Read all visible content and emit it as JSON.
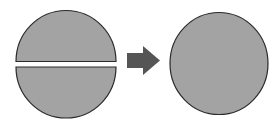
{
  "diagram": {
    "colors": {
      "fill": "#a3a3a3",
      "stroke": "#2a2a2a",
      "arrow": "#555555",
      "background": "#ffffff"
    },
    "left_shape": {
      "label": "split-circle",
      "parts": [
        "top-half",
        "bottom-half"
      ]
    },
    "arrow": {
      "direction": "right"
    },
    "right_shape": {
      "label": "whole-circle"
    }
  }
}
